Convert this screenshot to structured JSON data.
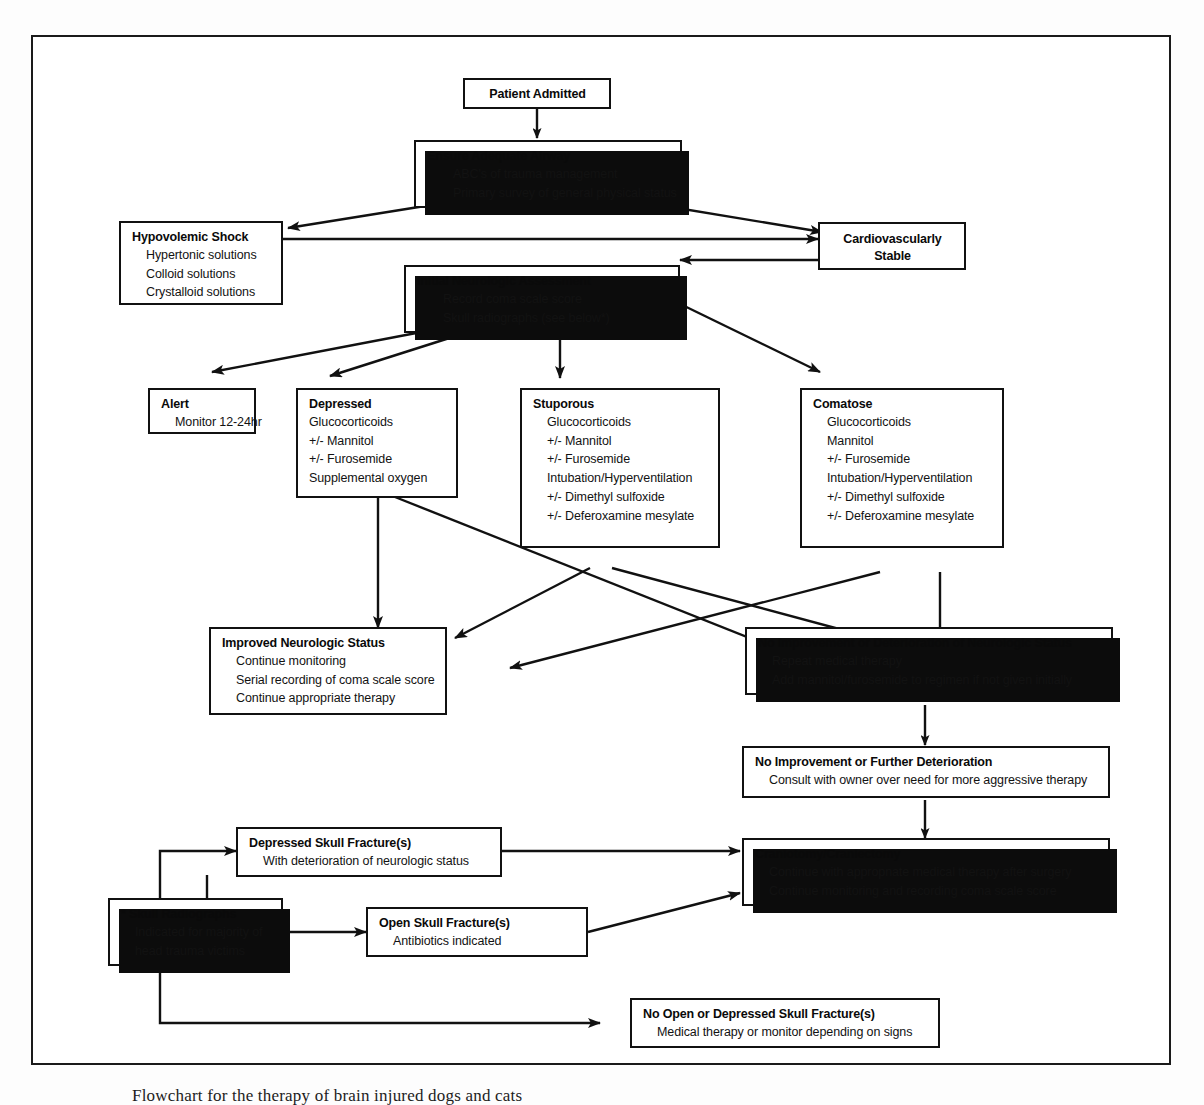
{
  "diagram": {
    "title": "Flowchart for the therapy of brain injured dogs and cats",
    "caption": "Flowchart for the therapy of brain injured dogs and cats",
    "nodes": {
      "patient_admitted": {
        "title": "Patient Admitted",
        "lines": []
      },
      "ensure_airway": {
        "title": "Ensure Adequate Airway",
        "lines": [
          "ABC's of trauma management",
          "Primary survey of general physical status"
        ]
      },
      "hypovolemic_shock": {
        "title": "Hypovolemic Shock",
        "lines": [
          "Hypertonic solutions",
          "Colloid solutions",
          "Crystalloid solutions"
        ]
      },
      "cardiovascularly_stable": {
        "title": "Cardiovascularly",
        "title2": "Stable",
        "lines": []
      },
      "initial_neuro": {
        "title": "Initial Neurologic Assessment",
        "lines": [
          "Record coma scale score",
          "Skull radiographs (see below*)"
        ]
      },
      "alert": {
        "title": "Alert",
        "lines": [
          "Monitor 12-24hr"
        ]
      },
      "depressed": {
        "title": "Depressed",
        "lines": [
          "Glucocorticoids",
          "+/- Mannitol",
          "+/- Furosemide",
          "Supplemental oxygen"
        ]
      },
      "stuporous": {
        "title": "Stuporous",
        "lines": [
          "Glucocorticoids",
          "+/- Mannitol",
          "+/- Furosemide",
          "Intubation/Hyperventilation",
          "+/-  Dimethyl sulfoxide",
          "+/- Deferoxamine mesylate"
        ]
      },
      "comatose": {
        "title": "Comatose",
        "lines": [
          "Glucocorticoids",
          "Mannitol",
          "+/- Furosemide",
          "Intubation/Hyperventilation",
          "+/-  Dimethyl sulfoxide",
          "+/- Deferoxamine mesylate"
        ]
      },
      "improved": {
        "title": "Improved Neurologic Status",
        "lines": [
          "Continue monitoring",
          "Serial recording of coma scale score",
          "Continue appropriate therapy"
        ]
      },
      "no_improvement": {
        "title": "No Improvement or Deterioration of Neurologic Status",
        "lines": [
          "Repeat medical therapy",
          "Add mannitol/furosemide to regimen if not given initially"
        ]
      },
      "further_deterioration": {
        "title": "No Improvement or Further Deterioration",
        "lines": [
          "Consult with owner over need for more aggressive therapy"
        ]
      },
      "depressed_fracture": {
        "title": "Depressed Skull Fracture(s)",
        "lines": [
          "With deterioration of neurologic status"
        ]
      },
      "craniotomy": {
        "title": "Craniotomy/Craniectomy",
        "lines": [
          "Continue with appropnate medical therapy  after surgery",
          "Continue monitoring and recording coma scale score"
        ]
      },
      "skull_radiographs": {
        "title": "* Skull Radiographs",
        "lines": [
          "Indicated for majority of",
          "head trauma victims"
        ]
      },
      "open_fracture": {
        "title": "Open Skull Fracture(s)",
        "lines": [
          "Antibiotics indicated"
        ]
      },
      "no_fracture": {
        "title": "No Open or Depressed Skull Fracture(s)",
        "lines": [
          "Medical therapy or monitor depending on signs"
        ]
      }
    },
    "colors": {
      "ink": "#111111",
      "shadow": "#0c0c0c",
      "paper": "#ffffff"
    }
  }
}
